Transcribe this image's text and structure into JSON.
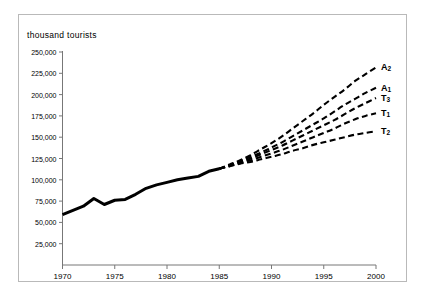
{
  "figure": {
    "axis_title": "thousand tourists",
    "frame_color": "#b9b9b9",
    "line_color": "#000000",
    "background": "#ffffff"
  },
  "axes": {
    "y_ticks": [
      "25,000",
      "50,000",
      "75,000",
      "100,000",
      "125,000",
      "150,000",
      "175,000",
      "200,000",
      "225,000",
      "250,000"
    ],
    "x_ticks": [
      "1970",
      "1975",
      "1980",
      "1985",
      "1990",
      "1995",
      "2000"
    ]
  },
  "series_labels": [
    {
      "name": "A",
      "sub": "2"
    },
    {
      "name": "A",
      "sub": "1"
    },
    {
      "name": "T",
      "sub": "3"
    },
    {
      "name": "T",
      "sub": "1"
    },
    {
      "name": "T",
      "sub": "2"
    }
  ],
  "chart_data": {
    "type": "line",
    "title": "",
    "xlabel": "",
    "ylabel": "thousand tourists",
    "xlim": [
      1970,
      2000
    ],
    "ylim": [
      0,
      250000
    ],
    "y_ticks": [
      25000,
      50000,
      75000,
      100000,
      125000,
      150000,
      175000,
      200000,
      225000,
      250000
    ],
    "x_ticks": [
      1970,
      1975,
      1980,
      1985,
      1990,
      1995,
      2000
    ],
    "grid": false,
    "legend_position": "right-inline-labels",
    "series": [
      {
        "name": "historical",
        "label": "",
        "style": "solid",
        "linewidth": 3,
        "x": [
          1970,
          1971,
          1972,
          1973,
          1974,
          1975,
          1976,
          1977,
          1978,
          1979,
          1980,
          1981,
          1982,
          1983,
          1984,
          1985
        ],
        "values": [
          59000,
          64000,
          69000,
          78000,
          71000,
          76000,
          77000,
          83000,
          90000,
          94000,
          97000,
          100000,
          102000,
          104000,
          110000,
          113000
        ]
      },
      {
        "name": "A2",
        "label": "A2",
        "style": "dashed",
        "x": [
          1985,
          1986,
          1987,
          1988,
          1989,
          1990,
          1991,
          1992,
          1993,
          1994,
          1995,
          1996,
          1997,
          1998,
          1999,
          2000
        ],
        "values": [
          113000,
          118000,
          123000,
          129000,
          136000,
          143000,
          151000,
          160000,
          169000,
          178000,
          188000,
          197000,
          206000,
          216000,
          224000,
          232000
        ]
      },
      {
        "name": "A1",
        "label": "A1",
        "style": "dashed",
        "x": [
          1985,
          1986,
          1987,
          1988,
          1989,
          1990,
          1991,
          1992,
          1993,
          1994,
          1995,
          1996,
          1997,
          1998,
          1999,
          2000
        ],
        "values": [
          113000,
          117000,
          122000,
          127000,
          132000,
          138000,
          144000,
          151000,
          158000,
          165000,
          172000,
          180000,
          188000,
          195000,
          202000,
          208000
        ]
      },
      {
        "name": "T3",
        "label": "T3",
        "style": "dashed",
        "x": [
          1985,
          1986,
          1987,
          1988,
          1989,
          1990,
          1991,
          1992,
          1993,
          1994,
          1995,
          1996,
          1997,
          1998,
          1999,
          2000
        ],
        "values": [
          113000,
          117000,
          121000,
          125000,
          130000,
          135000,
          140000,
          146000,
          152000,
          158000,
          164000,
          170000,
          177000,
          184000,
          190000,
          196000
        ]
      },
      {
        "name": "T1",
        "label": "T1",
        "style": "dashed",
        "x": [
          1985,
          1986,
          1987,
          1988,
          1989,
          1990,
          1991,
          1992,
          1993,
          1994,
          1995,
          1996,
          1997,
          1998,
          1999,
          2000
        ],
        "values": [
          113000,
          116000,
          120000,
          123000,
          127000,
          131000,
          135000,
          140000,
          145000,
          150000,
          155000,
          160000,
          166000,
          171000,
          175000,
          178000
        ]
      },
      {
        "name": "T2",
        "label": "T2",
        "style": "dashed",
        "x": [
          1985,
          1986,
          1987,
          1988,
          1989,
          1990,
          1991,
          1992,
          1993,
          1994,
          1995,
          1996,
          1997,
          1998,
          1999,
          2000
        ],
        "values": [
          113000,
          116000,
          119000,
          121000,
          124000,
          127000,
          130000,
          134000,
          137000,
          141000,
          144000,
          147000,
          150000,
          153000,
          155000,
          157000
        ]
      }
    ]
  }
}
